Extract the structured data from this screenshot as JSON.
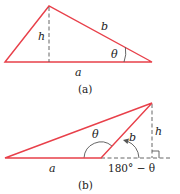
{
  "figure_a": {
    "caption": "(a)",
    "labels": {
      "height": "h",
      "side_b": "b",
      "side_a": "a",
      "angle": "θ"
    }
  },
  "figure_b": {
    "caption": "(b)",
    "labels": {
      "height": "h",
      "side_b": "b",
      "side_a": "a",
      "angle": "θ",
      "supplement": "180° − θ"
    }
  },
  "colors": {
    "triangle": "#e8404a",
    "construction": "#555555",
    "text": "#222222"
  }
}
